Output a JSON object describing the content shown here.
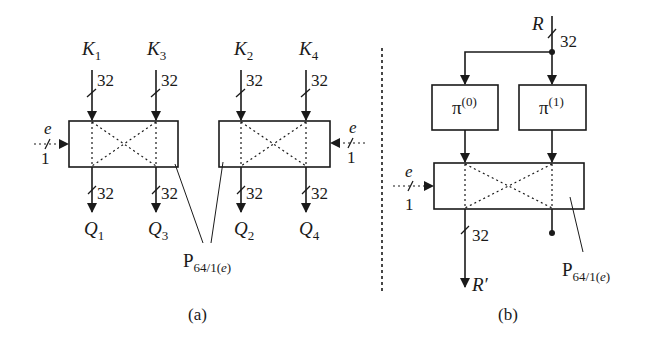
{
  "figure": {
    "panel_a": {
      "caption": "(a)",
      "inputs": [
        {
          "var": "K",
          "sub": "1",
          "width": "32"
        },
        {
          "var": "K",
          "sub": "3",
          "width": "32"
        },
        {
          "var": "K",
          "sub": "2",
          "width": "32"
        },
        {
          "var": "K",
          "sub": "4",
          "width": "32"
        }
      ],
      "outputs": [
        {
          "var": "Q",
          "sub": "1",
          "width": "32"
        },
        {
          "var": "Q",
          "sub": "3",
          "width": "32"
        },
        {
          "var": "Q",
          "sub": "2",
          "width": "32"
        },
        {
          "var": "Q",
          "sub": "4",
          "width": "32"
        }
      ],
      "control_left": {
        "var": "e",
        "width": "1"
      },
      "control_right": {
        "var": "e",
        "width": "1"
      },
      "block_label": {
        "main": "P",
        "sub": "64/1(",
        "sub_var": "e",
        "sub_end": ")"
      }
    },
    "panel_b": {
      "caption": "(b)",
      "input": {
        "var": "R",
        "width": "32"
      },
      "perm0": {
        "main": "π",
        "sup": "(0)"
      },
      "perm1": {
        "main": "π",
        "sup": "(1)"
      },
      "control": {
        "var": "e",
        "width": "1"
      },
      "output": {
        "var": "R′",
        "width": "32"
      },
      "block_label": {
        "main": "P",
        "sub": "64/1(",
        "sub_var": "e",
        "sub_end": ")"
      }
    },
    "colors": {
      "stroke": "#1a1a1a",
      "background": "#ffffff"
    }
  }
}
